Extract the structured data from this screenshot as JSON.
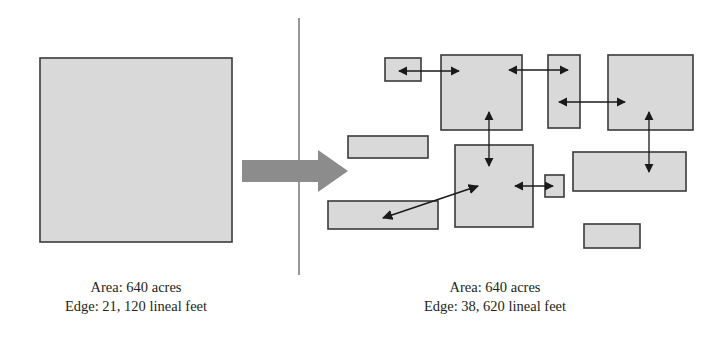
{
  "figure": {
    "divider": {
      "x": 299,
      "y1": 18,
      "y2": 275
    },
    "transform_arrow": {
      "name": "large-gray-right-arrow",
      "color": "#8c8c8c",
      "x1": 242,
      "x2": 348,
      "y": 171
    }
  },
  "panels": {
    "left": {
      "name": "intact-habitat-panel",
      "shape": {
        "x": 40,
        "y": 58,
        "w": 192,
        "h": 184,
        "fill": "#d9d9d9",
        "stroke": "#3a3a3a"
      },
      "caption": {
        "line1": "Area: 640 acres",
        "line2": "Edge: 21, 120 lineal feet"
      }
    },
    "right": {
      "name": "fragmented-habitat-panel",
      "caption": {
        "line1": "Area: 640 acres",
        "line2": "Edge: 38, 620 lineal feet"
      },
      "fragments": [
        {
          "id": "fragment-1",
          "x": 385,
          "y": 58,
          "w": 36,
          "h": 23
        },
        {
          "id": "fragment-2",
          "x": 441,
          "y": 55,
          "w": 81,
          "h": 75
        },
        {
          "id": "fragment-3",
          "x": 548,
          "y": 55,
          "w": 32,
          "h": 73
        },
        {
          "id": "fragment-4",
          "x": 608,
          "y": 55,
          "w": 85,
          "h": 75
        },
        {
          "id": "fragment-5",
          "x": 348,
          "y": 136,
          "w": 80,
          "h": 22
        },
        {
          "id": "fragment-6",
          "x": 455,
          "y": 145,
          "w": 78,
          "h": 82
        },
        {
          "id": "fragment-7",
          "x": 545,
          "y": 175,
          "w": 19,
          "h": 22
        },
        {
          "id": "fragment-8",
          "x": 573,
          "y": 152,
          "w": 113,
          "h": 39
        },
        {
          "id": "fragment-9",
          "x": 328,
          "y": 201,
          "w": 110,
          "h": 28
        },
        {
          "id": "fragment-10",
          "x": 584,
          "y": 224,
          "w": 56,
          "h": 24
        }
      ],
      "edge_arrows": [
        {
          "id": "edge-arrow-1",
          "orientation": "horizontal",
          "x1": 399,
          "y1": 71,
          "x2": 459,
          "y2": 71
        },
        {
          "id": "edge-arrow-2",
          "orientation": "horizontal",
          "x1": 509,
          "y1": 70,
          "x2": 568,
          "y2": 70
        },
        {
          "id": "edge-arrow-3",
          "orientation": "horizontal",
          "x1": 559,
          "y1": 102,
          "x2": 625,
          "y2": 102
        },
        {
          "id": "edge-arrow-4",
          "orientation": "vertical",
          "x1": 489,
          "y1": 112,
          "x2": 489,
          "y2": 166
        },
        {
          "id": "edge-arrow-5",
          "orientation": "vertical",
          "x1": 649,
          "y1": 112,
          "x2": 649,
          "y2": 172
        },
        {
          "id": "edge-arrow-6",
          "orientation": "horizontal",
          "x1": 553,
          "y1": 186,
          "x2": 515,
          "y2": 186
        },
        {
          "id": "edge-arrow-7",
          "orientation": "diagonal",
          "x1": 478,
          "y1": 186,
          "x2": 383,
          "y2": 218
        }
      ]
    }
  },
  "style": {
    "fragment_fill": "#d9d9d9",
    "fragment_stroke": "#3a3a3a",
    "arrow_color": "#1a1a1a",
    "divider_color": "#6b6b6b",
    "transform_arrow_color": "#8c8c8c",
    "text_color": "#231f20"
  }
}
